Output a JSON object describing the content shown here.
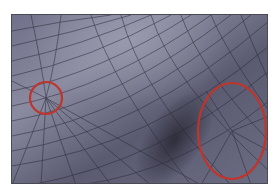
{
  "image": {
    "description": "Shaded 3D quad mesh surface with two red circled regions highlighting irregular vertices",
    "colors": {
      "background": "#ffffff",
      "mesh_light": "#8a8a9c",
      "mesh_mid": "#66667a",
      "mesh_dark": "#2e2e3c",
      "grid_line": "#2a2a36",
      "annotation": "#c0342c"
    },
    "annotations": [
      {
        "shape": "circle",
        "cx": 45,
        "cy": 97,
        "rx": 16,
        "ry": 16
      },
      {
        "shape": "ellipse",
        "cx": 231,
        "cy": 130,
        "rx": 34,
        "ry": 48
      }
    ]
  }
}
